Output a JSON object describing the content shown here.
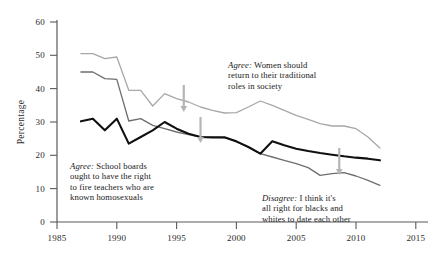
{
  "chart_data": {
    "type": "line",
    "title": "",
    "xlabel": "",
    "ylabel": "Percentage",
    "xlim": [
      1985,
      2015
    ],
    "ylim": [
      0,
      60
    ],
    "grid": false,
    "legend_position": "inline-annotations",
    "xticks": [
      "1985",
      "1990",
      "1995",
      "2000",
      "2005",
      "2010",
      "2015"
    ],
    "yticks": [
      "0",
      "10",
      "20",
      "30",
      "40",
      "50",
      "60"
    ],
    "x": [
      1987,
      1988,
      1989,
      1990,
      1991,
      1992,
      1993,
      1994,
      1995,
      1996,
      1997,
      1998,
      1999,
      2000,
      2001,
      2002,
      2003,
      2004,
      2005,
      2006,
      2007,
      2008,
      2009,
      2010,
      2011,
      2012
    ],
    "series": [
      {
        "name": "Agree: Women should return to their traditional roles in society",
        "color": "#a8a8a8",
        "values": [
          50.5,
          50.5,
          49.0,
          49.5,
          39.5,
          39.5,
          34.8,
          38.5,
          37.0,
          36.0,
          34.5,
          33.5,
          32.7,
          32.8,
          34.5,
          36.3,
          35.0,
          33.5,
          32.0,
          30.8,
          29.5,
          28.8,
          28.8,
          28.0,
          25.5,
          22.2
        ]
      },
      {
        "name": "Agree: School boards ought to have the right to fire teachers who are known homosexuals",
        "color": "#6e6e6e",
        "values": [
          45.0,
          45.0,
          43.0,
          42.8,
          30.3,
          31.0,
          29.0,
          28.0,
          27.0,
          26.2,
          25.5,
          25.4,
          25.3,
          24.0,
          22.5,
          20.5,
          19.5,
          18.5,
          17.5,
          16.3,
          14.0,
          14.5,
          14.8,
          13.8,
          12.5,
          11.0
        ]
      },
      {
        "name": "Disagree: I think it's all right for blacks and whites to date each other",
        "color": "#101010",
        "values": [
          30.2,
          31.0,
          27.5,
          31.0,
          23.5,
          25.5,
          27.5,
          30.0,
          28.0,
          26.5,
          25.5,
          25.4,
          25.4,
          24.2,
          22.5,
          20.5,
          24.2,
          23.0,
          22.0,
          21.3,
          20.7,
          20.2,
          19.7,
          19.3,
          19.0,
          18.5
        ]
      }
    ],
    "annotations": [
      {
        "name": "women-traditional-roles",
        "emphasis": "Agree:",
        "lines": [
          "Agree: Women should",
          "return to their traditional",
          "roles in society"
        ]
      },
      {
        "name": "school-boards-fire-teachers",
        "emphasis": "Agree:",
        "lines": [
          "Agree: School boards",
          "ought to have the right",
          "to fire teachers who are",
          "known homosexuals"
        ]
      },
      {
        "name": "interracial-dating",
        "emphasis": "Disagree:",
        "lines": [
          "Disagree: I think it's",
          "all right for blacks and",
          "whites to date each other"
        ]
      }
    ],
    "arrows": [
      {
        "name": "arrow-women-line",
        "x_year": 1995.6,
        "color": "#b5b5b5"
      },
      {
        "name": "arrow-black-line-mid",
        "x_year": 1997.0,
        "color": "#b5b5b5"
      },
      {
        "name": "arrow-black-line-right",
        "x_year": 2008.6,
        "color": "#b5b5b5"
      }
    ]
  },
  "axis": {
    "y_title": "Percentage",
    "y_ticks": [
      "60",
      "50",
      "40",
      "30",
      "20",
      "10",
      "0"
    ],
    "x_ticks": [
      "1985",
      "1990",
      "1995",
      "2000",
      "2005",
      "2010",
      "2015"
    ]
  },
  "annotation_text": {
    "women": {
      "l1": "Agree: Women should",
      "l2": "return to their traditional",
      "l3": "roles in society",
      "em": "Agree:",
      "l1rest": " Women should"
    },
    "school": {
      "em": "Agree:",
      "l1rest": " School boards",
      "l2": "ought to have the right",
      "l3": "to fire teachers who are",
      "l4": "known homosexuals"
    },
    "dating": {
      "em": "Disagree:",
      "l1rest": " I think it's",
      "l2": "all right for blacks and",
      "l3": "whites to date each other"
    }
  }
}
